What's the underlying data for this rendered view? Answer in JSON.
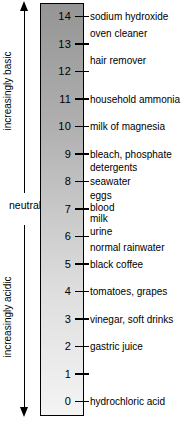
{
  "diagram": {
    "type": "ph-scale",
    "axis_labels": {
      "basic": "increasingly basic",
      "neutral": "neutral",
      "acidic": "increasingly acidic"
    },
    "scale": {
      "min": 0,
      "max": 14
    },
    "ticks": [
      14,
      13,
      12,
      11,
      10,
      9,
      8,
      7,
      6,
      5,
      4,
      3,
      2,
      1,
      0
    ],
    "substances": [
      {
        "ph": 14,
        "lines": [
          "sodium hydroxide"
        ]
      },
      {
        "ph": 13.4,
        "lines": [
          "oven cleaner"
        ]
      },
      {
        "ph": 12.4,
        "lines": [
          "hair remover"
        ]
      },
      {
        "ph": 11,
        "lines": [
          "household ammonia"
        ]
      },
      {
        "ph": 10,
        "lines": [
          "milk of magnesia"
        ]
      },
      {
        "ph": 9,
        "lines": [
          "bleach, phosphate",
          "detergents"
        ]
      },
      {
        "ph": 8,
        "lines": [
          "seawater"
        ]
      },
      {
        "ph": 7.5,
        "lines": [
          "eggs"
        ]
      },
      {
        "ph": 7.05,
        "lines": [
          "blood"
        ]
      },
      {
        "ph": 6.65,
        "lines": [
          "milk"
        ]
      },
      {
        "ph": 6.2,
        "lines": [
          "urine"
        ]
      },
      {
        "ph": 5.6,
        "lines": [
          "normal rainwater"
        ]
      },
      {
        "ph": 5,
        "lines": [
          "black coffee"
        ]
      },
      {
        "ph": 4,
        "lines": [
          "tomatoes, grapes"
        ]
      },
      {
        "ph": 3,
        "lines": [
          "vinegar, soft drinks"
        ]
      },
      {
        "ph": 2,
        "lines": [
          "gastric juice"
        ]
      },
      {
        "ph": 0,
        "lines": [
          "hydrochloric acid"
        ]
      }
    ],
    "colors": {
      "bar_top": "#959595",
      "bar_bottom": "#f4f4f4",
      "line": "#000000",
      "background": "#ffffff"
    }
  }
}
